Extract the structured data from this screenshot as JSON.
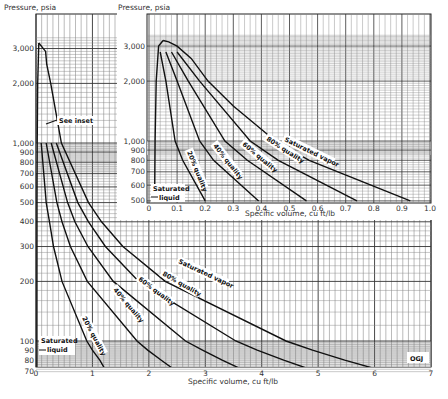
{
  "chart_data": [
    {
      "id": "main",
      "type": "line",
      "title": "",
      "xlabel": "Specific volume, cu ft/lb",
      "ylabel": "Pressure, psia",
      "xlim": [
        0,
        7
      ],
      "ylim": [
        70,
        3500
      ],
      "yscale": "log",
      "grid": true,
      "x_ticks": [
        "0",
        "1",
        "2",
        "3",
        "4",
        "5",
        "6",
        "7"
      ],
      "y_ticks": [
        {
          "v": 3000,
          "label": "3,000"
        },
        {
          "v": 2000,
          "label": "2,000"
        },
        {
          "v": 1000,
          "label": "1,000"
        },
        {
          "v": 900,
          "label": "900"
        },
        {
          "v": 800,
          "label": "800"
        },
        {
          "v": 700,
          "label": "700"
        },
        {
          "v": 600,
          "label": "600"
        },
        {
          "v": 500,
          "label": "500"
        },
        {
          "v": 400,
          "label": "400"
        },
        {
          "v": 300,
          "label": "300"
        },
        {
          "v": 200,
          "label": "200"
        },
        {
          "v": 100,
          "label": "100"
        },
        {
          "v": 90,
          "label": "90"
        },
        {
          "v": 80,
          "label": "80"
        },
        {
          "v": 70,
          "label": "70"
        }
      ],
      "series": [
        {
          "name": "Saturated liquid",
          "points": [
            [
              0.016,
              70
            ],
            [
              0.0175,
              500
            ],
            [
              0.0216,
              1000
            ],
            [
              0.03,
              2000
            ],
            [
              0.05,
              3200
            ]
          ]
        },
        {
          "name": "20% quality",
          "points": [
            [
              0.093,
              1000
            ],
            [
              0.18,
              500
            ],
            [
              0.24,
              400
            ],
            [
              0.31,
              300
            ],
            [
              0.46,
              200
            ],
            [
              0.9,
              100
            ],
            [
              1.0,
              90
            ],
            [
              1.13,
              80
            ],
            [
              1.25,
              70
            ]
          ]
        },
        {
          "name": "40% quality",
          "points": [
            [
              0.18,
              1000
            ],
            [
              0.37,
              500
            ],
            [
              0.46,
              400
            ],
            [
              0.61,
              300
            ],
            [
              0.91,
              200
            ],
            [
              1.79,
              100
            ],
            [
              1.98,
              90
            ],
            [
              2.22,
              80
            ],
            [
              2.5,
              70
            ]
          ]
        },
        {
          "name": "60% quality",
          "points": [
            [
              0.27,
              1000
            ],
            [
              0.56,
              500
            ],
            [
              0.69,
              400
            ],
            [
              0.92,
              300
            ],
            [
              1.37,
              200
            ],
            [
              2.65,
              100
            ],
            [
              2.95,
              90
            ],
            [
              3.3,
              80
            ],
            [
              3.74,
              70
            ]
          ]
        },
        {
          "name": "80% quality",
          "points": [
            [
              0.36,
              1000
            ],
            [
              0.74,
              500
            ],
            [
              0.93,
              400
            ],
            [
              1.23,
              300
            ],
            [
              1.82,
              200
            ],
            [
              3.54,
              100
            ],
            [
              3.92,
              90
            ],
            [
              4.39,
              80
            ],
            [
              4.98,
              70
            ]
          ]
        },
        {
          "name": "Saturated vapor",
          "points": [
            [
              0.05,
              3200
            ],
            [
              0.17,
              2900
            ],
            [
              0.19,
              2500
            ],
            [
              0.26,
              2000
            ],
            [
              0.45,
              1000
            ],
            [
              0.93,
              500
            ],
            [
              1.16,
              400
            ],
            [
              1.54,
              300
            ],
            [
              2.29,
              200
            ],
            [
              4.43,
              100
            ],
            [
              4.9,
              90
            ],
            [
              5.47,
              80
            ],
            [
              6.2,
              70
            ]
          ]
        }
      ],
      "annotations": [
        "See inset",
        "Saturated liquid",
        "OGJ"
      ]
    },
    {
      "id": "inset",
      "type": "line",
      "title": "",
      "xlabel": "Specific volume, cu ft/lb",
      "ylabel": "Pressure, psia",
      "xlim": [
        0,
        1.0
      ],
      "ylim": [
        500,
        3500
      ],
      "yscale": "log",
      "grid": true,
      "x_ticks": [
        "0",
        "0.1",
        "0.2",
        "0.3",
        "0.4",
        "0.5",
        "0.6",
        "0.7",
        "0.8",
        "0.9",
        "1.0"
      ],
      "y_ticks": [
        {
          "v": 3000,
          "label": "3,000"
        },
        {
          "v": 2000,
          "label": "2,000"
        },
        {
          "v": 1000,
          "label": "1,000"
        },
        {
          "v": 900,
          "label": "900"
        },
        {
          "v": 800,
          "label": "800"
        },
        {
          "v": 700,
          "label": "700"
        },
        {
          "v": 600,
          "label": "600"
        },
        {
          "v": 500,
          "label": "500"
        }
      ],
      "series": [
        {
          "name": "Saturated liquid",
          "points": [
            [
              0.0198,
              500
            ],
            [
              0.0216,
              1000
            ],
            [
              0.0257,
              2000
            ],
            [
              0.034,
              3000
            ],
            [
              0.05,
              3200
            ]
          ]
        },
        {
          "name": "20% quality",
          "points": [
            [
              0.04,
              2800
            ],
            [
              0.06,
              2000
            ],
            [
              0.093,
              1000
            ],
            [
              0.12,
              800
            ],
            [
              0.2,
              500
            ]
          ]
        },
        {
          "name": "40% quality",
          "points": [
            [
              0.06,
              2800
            ],
            [
              0.1,
              2000
            ],
            [
              0.18,
              1000
            ],
            [
              0.23,
              800
            ],
            [
              0.39,
              500
            ]
          ]
        },
        {
          "name": "60% quality",
          "points": [
            [
              0.08,
              2800
            ],
            [
              0.14,
              2000
            ],
            [
              0.27,
              1000
            ],
            [
              0.35,
              800
            ],
            [
              0.56,
              500
            ]
          ]
        },
        {
          "name": "80% quality",
          "points": [
            [
              0.1,
              2800
            ],
            [
              0.18,
              2000
            ],
            [
              0.36,
              1000
            ],
            [
              0.46,
              800
            ],
            [
              0.74,
              500
            ]
          ]
        },
        {
          "name": "Saturated vapor",
          "points": [
            [
              0.05,
              3200
            ],
            [
              0.07,
              3150
            ],
            [
              0.1,
              3000
            ],
            [
              0.15,
              2600
            ],
            [
              0.21,
              2000
            ],
            [
              0.3,
              1500
            ],
            [
              0.45,
              1000
            ],
            [
              0.57,
              800
            ],
            [
              0.93,
              500
            ]
          ]
        }
      ],
      "curve_labels": [
        "20% quality",
        "40% quality",
        "60% quality",
        "80% quality",
        "Saturated vapor",
        "Saturated liquid"
      ]
    }
  ],
  "labels": {
    "main_ylabel": "Pressure, psia",
    "main_xlabel": "Specific volume, cu ft/lb",
    "inset_ylabel": "Pressure, psia",
    "inset_xlabel": "Specific volume, cu ft/lb",
    "see_inset": "See inset",
    "sat_liquid_l1": "Saturated",
    "sat_liquid_l2": "liquid",
    "q20": "20% quality",
    "q40": "40% quality",
    "q60": "60% quality",
    "q80": "80% quality",
    "sat_vapor": "Saturated vapor",
    "source": "OGJ"
  }
}
